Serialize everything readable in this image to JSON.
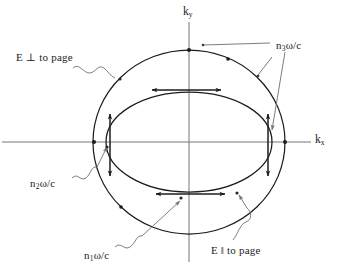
{
  "figure": {
    "kind": "wave-vector-surface-diagram",
    "background_color": "#ffffff",
    "stroke_color": "#1c1c1c",
    "leader_color": "#6e6e6e"
  },
  "axes": {
    "x_label": "k",
    "x_subscript": "x",
    "y_label": "k",
    "y_subscript": "y",
    "origin": {
      "x": 189,
      "y": 142
    },
    "x_axis_span": [
      2,
      311
    ],
    "y_axis_span": [
      22,
      262
    ]
  },
  "curves": {
    "outer_circle": {
      "name": "n3-circle",
      "radius_x": 96,
      "radius_y": 92,
      "label_ref": "n3"
    },
    "inner_ellipse": {
      "name": "n1-n2-ellipse",
      "radius_x": 83,
      "radius_y": 50,
      "label_ref": "n1"
    }
  },
  "labels": {
    "n3": {
      "text": "n",
      "sub": "3",
      "tail": "ω/c",
      "x": 276,
      "y": 46
    },
    "n2": {
      "text": "n",
      "sub": "2",
      "tail": "ω/c",
      "x": 35,
      "y": 182
    },
    "n1": {
      "text": "n",
      "sub": "1",
      "tail": "ω/c",
      "x": 88,
      "y": 256
    },
    "e_perp": {
      "text": "E ⊥ to page",
      "x": 18,
      "y": 57
    },
    "e_parallel": {
      "text": "E ‖ to page",
      "x": 213,
      "y": 250
    }
  },
  "polarization_arrows": [
    {
      "name": "arrow-top-horizontal",
      "orientation": "horizontal",
      "x1": 152,
      "y1": 90,
      "x2": 221,
      "y2": 90
    },
    {
      "name": "arrow-bottom-horizontal",
      "orientation": "horizontal",
      "x1": 156,
      "y1": 194,
      "x2": 225,
      "y2": 194
    },
    {
      "name": "arrow-left-vertical",
      "orientation": "vertical",
      "x1": 110,
      "y1": 114,
      "x2": 110,
      "y2": 176
    },
    {
      "name": "arrow-right-vertical",
      "orientation": "vertical",
      "x1": 268,
      "y1": 114,
      "x2": 268,
      "y2": 176
    }
  ],
  "markers": [
    {
      "name": "marker-circle-top",
      "x": 189,
      "y": 50
    },
    {
      "name": "marker-circle-right",
      "x": 285,
      "y": 142
    },
    {
      "name": "marker-circle-left",
      "x": 94,
      "y": 142
    },
    {
      "name": "marker-circle-upper-right",
      "x": 228,
      "y": 59
    },
    {
      "name": "marker-circle-upper-left",
      "x": 120,
      "y": 98
    },
    {
      "name": "marker-circle-lower-left",
      "x": 121,
      "y": 208
    },
    {
      "name": "marker-ellipse-left",
      "x": 107,
      "y": 145
    },
    {
      "name": "marker-ellipse-bottom",
      "x": 181,
      "y": 198
    },
    {
      "name": "marker-ellipse-lower-right",
      "x": 236,
      "y": 192
    },
    {
      "name": "marker-leader-n3-a",
      "x": 205,
      "y": 44
    },
    {
      "name": "marker-leader-n3-b",
      "x": 270,
      "y": 72
    }
  ]
}
